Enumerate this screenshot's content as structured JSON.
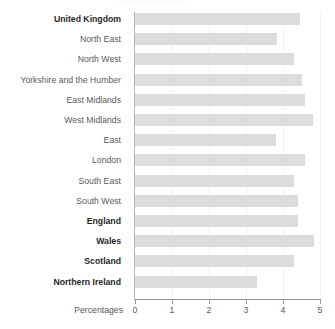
{
  "chart_data": {
    "type": "bar",
    "orientation": "horizontal",
    "title": "",
    "subtitle": "",
    "xlabel": "Percentages",
    "ylabel": "",
    "xlim": [
      0,
      5
    ],
    "ylim": null,
    "grid": true,
    "legend": null,
    "legend_position": "none",
    "xticks": [
      "0",
      "1",
      "2",
      "3",
      "4",
      "5"
    ],
    "xtick_values": [
      0,
      1,
      2,
      3,
      4,
      5
    ],
    "bar_color": "#dcdcdc",
    "categories": [
      "United Kingdom",
      "North East",
      "North West",
      "Yorkshire and the Humber",
      "East Midlands",
      "West Midlands",
      "East",
      "London",
      "South East",
      "South West",
      "England",
      "Wales",
      "Scotland",
      "Northern Ireland"
    ],
    "values": [
      4.45,
      3.85,
      4.3,
      4.5,
      4.6,
      4.8,
      3.8,
      4.6,
      4.3,
      4.4,
      4.4,
      4.85,
      4.3,
      3.3
    ],
    "emphasis": [
      true,
      false,
      false,
      false,
      false,
      false,
      false,
      false,
      false,
      false,
      true,
      true,
      true,
      true
    ],
    "annotations": []
  }
}
